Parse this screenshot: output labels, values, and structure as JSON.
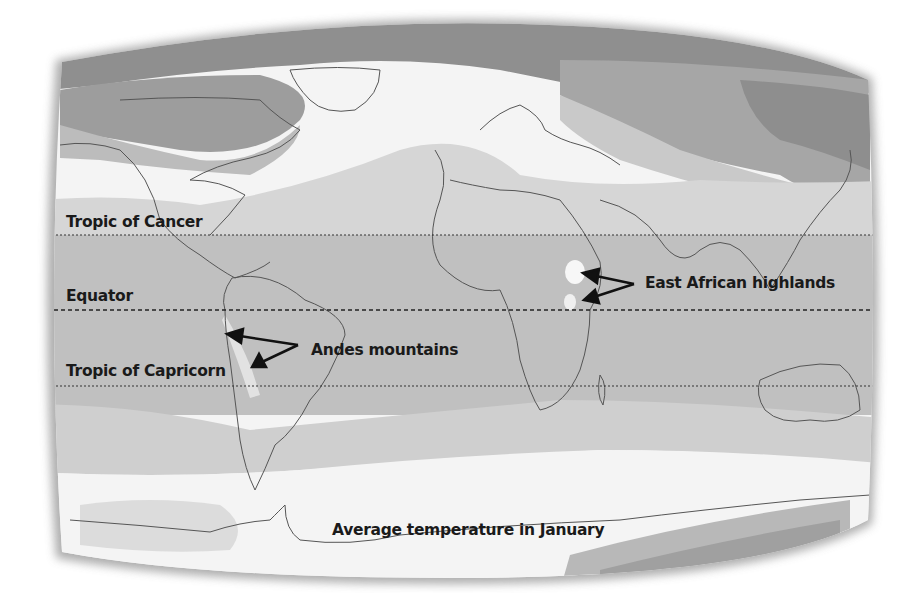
{
  "map": {
    "title": "Average temperature in January",
    "type": "world climate map (grayscale temperature bands)",
    "colors": {
      "frame_shadow": "#9a9a9a",
      "coldest": "#8f8f8f",
      "very_cold": "#a8a8a8",
      "cold": "#c4c4c4",
      "cool": "#e9e9e9",
      "mild": "#f7f7f7",
      "warm": "#d2d2d2",
      "hot": "#bdbdbd",
      "coastline": "#555555",
      "reference_line": "#333333",
      "text": "#1a1a1a"
    },
    "reference_lines": [
      {
        "name": "Tropic of Cancer",
        "y": 235
      },
      {
        "name": "Equator",
        "y": 310
      },
      {
        "name": "Tropic of Capricorn",
        "y": 386
      }
    ],
    "annotations": [
      {
        "label": "Andes mountains",
        "arrows_to": "western South America highlands"
      },
      {
        "label": "East African highlands",
        "arrows_to": "Ethiopia and Kenya highlands"
      }
    ]
  },
  "labels": {
    "tropic_cancer": "Tropic of Cancer",
    "equator": "Equator",
    "tropic_capricorn": "Tropic of Capricorn",
    "andes": "Andes mountains",
    "east_africa": "East African highlands",
    "caption": "Average temperature in January"
  }
}
